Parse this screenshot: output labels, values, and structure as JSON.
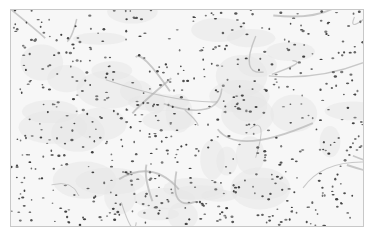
{
  "image": {
    "subject": "histology micrograph, grayscale, dense scattered nuclei with fibrous stroma",
    "colors": {
      "background": "#f7f7f7",
      "border": "#c8c8c8",
      "nucleus": "#5a5a5a",
      "fiber": "#b4b4b4"
    },
    "nuclei_count": 620,
    "fiber_count": 22
  }
}
